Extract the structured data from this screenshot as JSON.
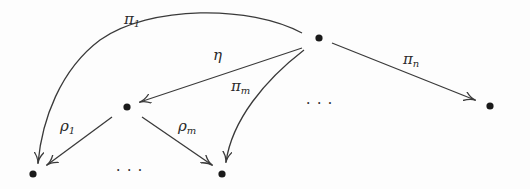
{
  "diagram": {
    "type": "commutative-diagram",
    "background": "#fdfdfd",
    "node_color": "#1a1a1a",
    "edge_color": "#3a3a3a",
    "nodes": [
      {
        "id": "top",
        "x": 319,
        "y": 38
      },
      {
        "id": "mid",
        "x": 127,
        "y": 107
      },
      {
        "id": "right",
        "x": 490,
        "y": 106
      },
      {
        "id": "bottom-left",
        "x": 33,
        "y": 174
      },
      {
        "id": "bottom-mid",
        "x": 222,
        "y": 174
      }
    ],
    "edges": [
      {
        "id": "pi1",
        "from": "top",
        "to": "bottom-left",
        "curved": true,
        "label": {
          "base": "π",
          "sub": "1"
        }
      },
      {
        "id": "eta",
        "from": "top",
        "to": "mid",
        "curved": false,
        "label": {
          "base": "η",
          "sub": ""
        }
      },
      {
        "id": "pim",
        "from": "top",
        "to": "bottom-mid",
        "curved": true,
        "label": {
          "base": "π",
          "sub": "m"
        }
      },
      {
        "id": "pin",
        "from": "top",
        "to": "right",
        "curved": false,
        "label": {
          "base": "π",
          "sub": "n"
        }
      },
      {
        "id": "rho1",
        "from": "mid",
        "to": "bottom-left",
        "curved": false,
        "label": {
          "base": "ρ",
          "sub": "1"
        }
      },
      {
        "id": "rhom",
        "from": "mid",
        "to": "bottom-mid",
        "curved": false,
        "label": {
          "base": "ρ",
          "sub": "m"
        }
      }
    ],
    "ellipses": [
      {
        "id": "ellipsis-middle-row",
        "text": "· · ·"
      },
      {
        "id": "ellipsis-bottom-row",
        "text": "· · ·"
      }
    ]
  }
}
